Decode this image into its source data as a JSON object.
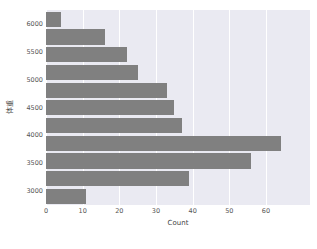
{
  "chart_data": {
    "type": "bar",
    "orientation": "horizontal",
    "title": "",
    "xlabel": "Count",
    "ylabel": "体重",
    "xlim": [
      0,
      72
    ],
    "ylim": [
      2750,
      6250
    ],
    "grid": true,
    "legend": null,
    "bar_color": "#808080",
    "plot_background": "#eaeaf2",
    "gridline_color": "#ffffff",
    "xticks": [
      0,
      10,
      20,
      30,
      40,
      50,
      60
    ],
    "xtick_labels": [
      "0",
      "10",
      "20",
      "30",
      "40",
      "50",
      "60"
    ],
    "yticks": [
      3000,
      3500,
      4000,
      4500,
      5000,
      5500,
      6000
    ],
    "ytick_labels": [
      "3000",
      "3500",
      "4000",
      "4500",
      "5000",
      "5500",
      "6000"
    ],
    "bins": [
      {
        "center": 6125,
        "label": "6125",
        "value": 4
      },
      {
        "center": 5875,
        "label": "5875",
        "value": 16
      },
      {
        "center": 5625,
        "label": "5625",
        "value": 22
      },
      {
        "center": 5375,
        "label": "5375",
        "value": 25
      },
      {
        "center": 5125,
        "label": "5125",
        "value": 33
      },
      {
        "center": 4875,
        "label": "4875",
        "value": 35
      },
      {
        "center": 4625,
        "label": "4625",
        "value": 37
      },
      {
        "center": 4375,
        "label": "4375",
        "value": 64
      },
      {
        "center": 4125,
        "label": "4125",
        "value": 56
      },
      {
        "center": 3875,
        "label": "3875",
        "value": 39
      },
      {
        "center": 3625,
        "label": "3625",
        "value": 11
      }
    ],
    "categories": [
      "6125",
      "5875",
      "5625",
      "5375",
      "5125",
      "4875",
      "4625",
      "4375",
      "4125",
      "3875",
      "3625"
    ],
    "values": [
      4,
      16,
      22,
      25,
      33,
      35,
      37,
      64,
      56,
      39,
      11
    ]
  }
}
